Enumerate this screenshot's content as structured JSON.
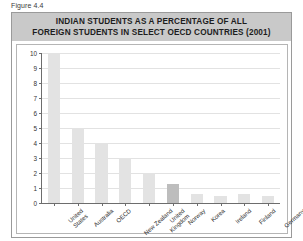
{
  "figure": {
    "caption": "Figure 4.4",
    "title_line1": "INDIAN STUDENTS AS A PERCENTAGE OF ALL",
    "title_line2": "FOREIGN STUDENTS IN SELECT OECD COUNTRIES (2001)"
  },
  "colors": {
    "band_background": "#c9c9c9",
    "bar_fill": "#e3e3e3",
    "bar_accent_fill": "#bdbdbd",
    "axis": "#6d6d6d",
    "gridline": "#e2e2e2",
    "panel_border": "#9a9a9a"
  },
  "chart_data": {
    "type": "bar",
    "title": "INDIAN STUDENTS AS A PERCENTAGE OF ALL FOREIGN STUDENTS IN SELECT OECD COUNTRIES (2001)",
    "xlabel": "",
    "ylabel": "",
    "ylim": [
      0,
      10
    ],
    "yticks": [
      0,
      1,
      2,
      3,
      4,
      5,
      6,
      7,
      8,
      9,
      10
    ],
    "ytick_labels": [
      "0",
      "1",
      "2",
      "3",
      "4",
      "5",
      "6",
      "7",
      "8",
      "9",
      "10"
    ],
    "grid": true,
    "legend": "none",
    "categories": [
      "United States",
      "Australia",
      "OECD",
      "New Zealand",
      "United Kingdom",
      "Norway",
      "Korea",
      "Ireland",
      "Finland",
      "Germany"
    ],
    "category_lines": [
      [
        "United",
        "States"
      ],
      [
        "Australia"
      ],
      [
        "OECD"
      ],
      [
        "New Zealand"
      ],
      [
        "United",
        "Kingdom"
      ],
      [
        "Norway"
      ],
      [
        "Korea"
      ],
      [
        "Ireland"
      ],
      [
        "Finland"
      ],
      [
        "Germany"
      ]
    ],
    "values": [
      10,
      5,
      4,
      3,
      2,
      1.3,
      0.6,
      0.5,
      0.6,
      0.5
    ],
    "highlight_index": 5
  }
}
